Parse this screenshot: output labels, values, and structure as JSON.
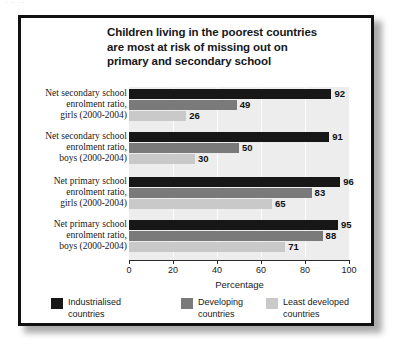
{
  "page": {
    "scan_artifact_text": "· ·· ···"
  },
  "chart_data": {
    "type": "bar",
    "orientation": "horizontal",
    "title": "Children living in the poorest countries are most at risk of missing out on primary and secondary school",
    "title_lines": [
      "Children living in the poorest countries",
      "are most at risk of missing out on",
      "primary and secondary school"
    ],
    "xlabel": "Percentage",
    "ylabel": "",
    "xlim": [
      0,
      100
    ],
    "xticks": [
      "0",
      "20",
      "40",
      "60",
      "80",
      "100"
    ],
    "grid": true,
    "legend_position": "bottom",
    "categories": [
      "Net secondary school enrolment ratio, girls (2000-2004)",
      "Net secondary school enrolment ratio, boys (2000-2004)",
      "Net primary school enrolment ratio, girls (2000-2004)",
      "Net primary school enrolment ratio, boys (2000-2004)"
    ],
    "category_lines": [
      [
        "Net secondary school",
        "enrolment ratio,",
        "girls (2000-2004)"
      ],
      [
        "Net secondary school",
        "enrolment ratio,",
        "boys (2000-2004)"
      ],
      [
        "Net primary school",
        "enrolment ratio,",
        "girls (2000-2004)"
      ],
      [
        "Net primary school",
        "enrolment ratio,",
        "boys (2000-2004)"
      ]
    ],
    "series": [
      {
        "name": "Industrialised countries",
        "name_lines": [
          "Industrialised",
          "countries"
        ],
        "color": "#171717",
        "values": [
          92,
          91,
          96,
          95
        ]
      },
      {
        "name": "Developing countries",
        "name_lines": [
          "Developing",
          "countries"
        ],
        "color": "#7a7a7a",
        "values": [
          49,
          50,
          83,
          88
        ]
      },
      {
        "name": "Least developed countries",
        "name_lines": [
          "Least developed",
          "countries"
        ],
        "color": "#c9c9c9",
        "values": [
          26,
          30,
          65,
          71
        ]
      }
    ]
  }
}
